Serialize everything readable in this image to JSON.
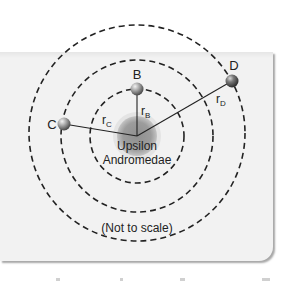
{
  "figure": {
    "star_label_line1": "Upsilon",
    "star_label_line2": "Andromedae",
    "note": "(Not to scale)",
    "planets": [
      {
        "name": "B",
        "radius_label_base": "r",
        "radius_label_sub": "B"
      },
      {
        "name": "C",
        "radius_label_base": "r",
        "radius_label_sub": "C"
      },
      {
        "name": "D",
        "radius_label_base": "r",
        "radius_label_sub": "D"
      }
    ],
    "colors": {
      "panel": "#f1f1f1",
      "star": "#9a9a9a",
      "orbit": "#222222",
      "planet": "#8c8c8c"
    }
  }
}
